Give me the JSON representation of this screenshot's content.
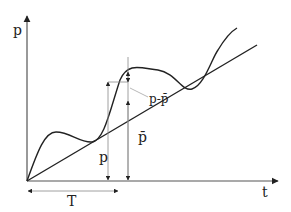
{
  "labels": {
    "y_axis": "p",
    "x_axis": "t",
    "period": "T",
    "instant_value": "p",
    "mean_value": "p̄",
    "deviation": "p-p̄"
  },
  "colors": {
    "stroke": "#222222",
    "guide": "#888888",
    "background": "#ffffff"
  },
  "description": {
    "curves": [
      "fluctuating quantity p(t)",
      "mean trend p̄(t)"
    ]
  }
}
